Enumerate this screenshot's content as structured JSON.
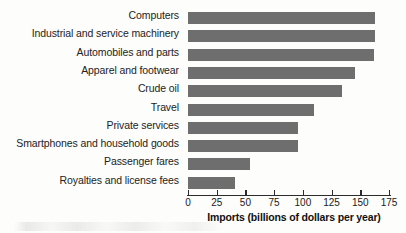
{
  "chart_data": {
    "type": "bar",
    "orientation": "horizontal",
    "title": "",
    "xlabel": "Imports (billions of dollars per year)",
    "ylabel": "",
    "xlim": [
      0,
      175
    ],
    "xticks": [
      0,
      25,
      50,
      75,
      100,
      125,
      150,
      175
    ],
    "xtick_labels": [
      "0",
      "25",
      "50",
      "75",
      "100",
      "125",
      "150",
      "175"
    ],
    "grid": false,
    "legend": null,
    "bar_color": "#6e6e6e",
    "categories": [
      "Computers",
      "Industrial and service machinery",
      "Automobiles and parts",
      "Apparel and footwear",
      "Crude oil",
      "Travel",
      "Private services",
      "Smartphones and household goods",
      "Passenger fares",
      "Royalties and license fees"
    ],
    "values": [
      163,
      163,
      162,
      145,
      134,
      110,
      96,
      96,
      54,
      41
    ]
  }
}
